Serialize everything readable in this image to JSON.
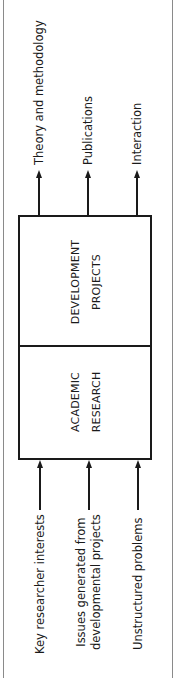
{
  "diagram": {
    "outputs": [
      {
        "label": "Theory and methodology",
        "x": 39
      },
      {
        "label": "Publications",
        "x": 88
      },
      {
        "label": "Interaction",
        "x": 137
      }
    ],
    "boxes": {
      "development": {
        "line1": "DEVELOPMENT",
        "line2": "PROJECTS"
      },
      "academic": {
        "line1": "ACADEMIC",
        "line2": "RESEARCH"
      }
    },
    "inputs": [
      {
        "label": "Key researcher interests",
        "x": 40
      },
      {
        "line1": "Issues generated from",
        "line2": "developmental projects",
        "x": 89
      },
      {
        "label": "Unstructured problems",
        "x": 138
      }
    ],
    "colors": {
      "line": "#1a1a1a",
      "frame": "#8a8a8a",
      "background": "#ffffff"
    }
  }
}
